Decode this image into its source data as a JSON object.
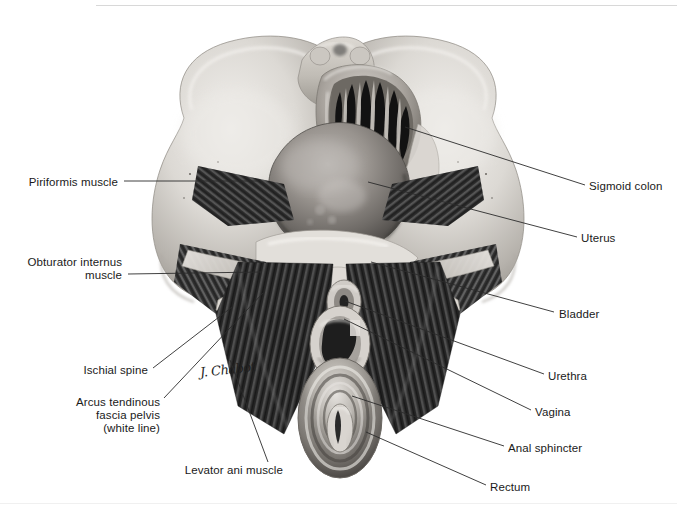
{
  "figure": {
    "signature": "J. Chabot",
    "bottom_caption": "",
    "colors": {
      "background": "#ffffff",
      "label_text": "#1a1a1a",
      "leader_line": "#2b2b2b",
      "bone_light": "#e8e6e2",
      "bone_mid": "#bfbcb6",
      "bone_shadow": "#8e8b86",
      "muscle_dark": "#3a3a3a",
      "muscle_mid": "#6e6e6e",
      "organ_mid": "#8a8a8a",
      "organ_dark": "#2a2a2a"
    }
  },
  "labels": [
    {
      "id": "piriformis-muscle",
      "text": "Piriformis muscle",
      "side": "left",
      "x": 118,
      "y": 176,
      "leader": {
        "x1": 124,
        "y1": 181,
        "x2": 258,
        "y2": 181
      }
    },
    {
      "id": "obturator-internus-muscle",
      "text": "Obturator internus\nmuscle",
      "side": "left",
      "x": 122,
      "y": 256,
      "leader": {
        "x1": 128,
        "y1": 274,
        "x2": 262,
        "y2": 272
      }
    },
    {
      "id": "ischial-spine",
      "text": "Ischial spine",
      "side": "left",
      "x": 148,
      "y": 364,
      "leader": {
        "x1": 153,
        "y1": 368,
        "x2": 232,
        "y2": 307
      }
    },
    {
      "id": "arcus-tendinous-fascia-pelvis",
      "text": "Arcus tendinous\nfascia pelvis\n(white line)",
      "side": "left",
      "x": 160,
      "y": 396,
      "leader": {
        "x1": 164,
        "y1": 398,
        "x2": 263,
        "y2": 293
      }
    },
    {
      "id": "levator-ani-muscle",
      "text": "Levator ani muscle",
      "side": "left",
      "x": 283,
      "y": 464,
      "leader": {
        "x1": 268,
        "y1": 462,
        "x2": 230,
        "y2": 360
      }
    },
    {
      "id": "sigmoid-colon",
      "text": "Sigmoid colon",
      "side": "right",
      "x": 589,
      "y": 180,
      "leader": {
        "x1": 585,
        "y1": 185,
        "x2": 405,
        "y2": 127
      }
    },
    {
      "id": "uterus",
      "text": "Uterus",
      "side": "right",
      "x": 581,
      "y": 232,
      "leader": {
        "x1": 577,
        "y1": 237,
        "x2": 368,
        "y2": 182
      }
    },
    {
      "id": "bladder",
      "text": "Bladder",
      "side": "right",
      "x": 559,
      "y": 308,
      "leader": {
        "x1": 554,
        "y1": 312,
        "x2": 371,
        "y2": 262
      }
    },
    {
      "id": "urethra",
      "text": "Urethra",
      "side": "right",
      "x": 548,
      "y": 370,
      "leader": {
        "x1": 544,
        "y1": 374,
        "x2": 345,
        "y2": 301
      }
    },
    {
      "id": "vagina",
      "text": "Vagina",
      "side": "right",
      "x": 535,
      "y": 406,
      "leader": {
        "x1": 531,
        "y1": 410,
        "x2": 344,
        "y2": 319
      }
    },
    {
      "id": "anal-sphincter",
      "text": "Anal sphincter",
      "side": "right",
      "x": 508,
      "y": 442,
      "leader": {
        "x1": 504,
        "y1": 446,
        "x2": 352,
        "y2": 396
      }
    },
    {
      "id": "rectum",
      "text": "Rectum",
      "side": "right",
      "x": 490,
      "y": 481,
      "leader": {
        "x1": 486,
        "y1": 485,
        "x2": 366,
        "y2": 432
      }
    }
  ]
}
